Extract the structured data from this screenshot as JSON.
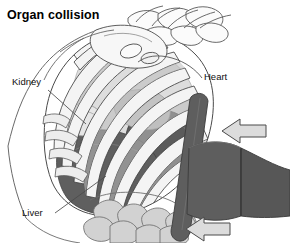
{
  "figure": {
    "title": "Organ collision",
    "width": 290,
    "height": 243,
    "background": "#ffffff",
    "type": "anatomical-illustration"
  },
  "labels": {
    "kidney": "Kidney",
    "heart": "Heart",
    "liver": "Liver"
  },
  "colors": {
    "outline": "#3b3b3b",
    "line_thin": "#555555",
    "bone_light": "#f2f2f2",
    "bone_shade": "#d9d9d9",
    "rib_fill": "#ededed",
    "rib_shade": "#c6c6c6",
    "organ_dark": "#5b5b5b",
    "organ_mid": "#8a8a8a",
    "organ_light": "#b8b8b8",
    "intestine": "#cfcfcf",
    "belt": "#5e5e5e",
    "belt_dark": "#4c4c4c",
    "arrow_fill": "#dcdcdc",
    "arrow_stroke": "#4a4a4a",
    "text": "#111111"
  },
  "annotations": {
    "arrows": [
      {
        "name": "impact-arrow-upper",
        "direction": "left",
        "x": 218,
        "y": 120
      },
      {
        "name": "impact-arrow-lower",
        "direction": "left",
        "x": 182,
        "y": 216
      }
    ],
    "leaders": [
      {
        "from": "kidney",
        "to": "kidney-organ"
      },
      {
        "from": "heart",
        "to": "heart-organ"
      },
      {
        "from": "liver",
        "to": "liver-organ"
      }
    ]
  }
}
